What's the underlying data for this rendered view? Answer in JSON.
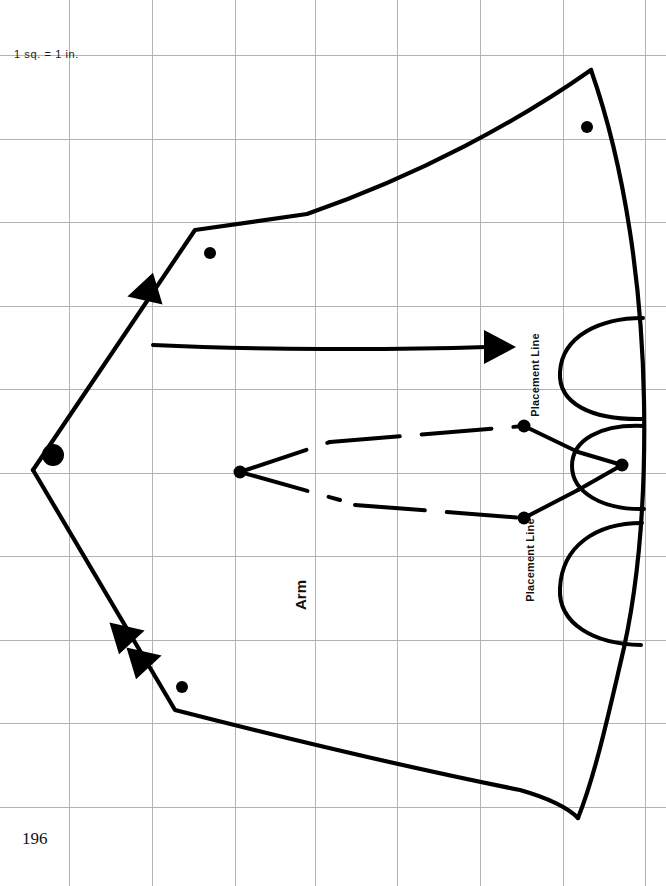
{
  "page": {
    "width": 666,
    "height": 886,
    "background": "#ffffff",
    "page_number": "196"
  },
  "grid": {
    "note": "1 sq.  =  1 in.",
    "line_color": "#b3b3b3",
    "line_width": 1,
    "spacing_px": 83,
    "vertical_lines": [
      69,
      152,
      235,
      315,
      397,
      480,
      563,
      645
    ],
    "horizontal_lines": [
      55,
      139,
      222,
      306,
      389,
      473,
      556,
      640,
      723,
      807
    ]
  },
  "pattern": {
    "label": "Arm",
    "ink_color": "#000000",
    "outline_width": 4,
    "placement_lines": [
      {
        "id": "top",
        "text": "Placement Line"
      },
      {
        "id": "bottom",
        "text": "Placement Line"
      }
    ],
    "markings": {
      "grain_arrow": {
        "name": "grainline-arrow",
        "from_x": 153,
        "to_x": 512,
        "y": 348
      },
      "dots": [
        {
          "cx": 53,
          "cy": 455,
          "r": 11
        },
        {
          "cx": 210,
          "cy": 253,
          "r": 6
        },
        {
          "cx": 587,
          "cy": 127,
          "r": 6
        },
        {
          "cx": 182,
          "cy": 687,
          "r": 6
        }
      ],
      "pivot_dots": [
        {
          "cx": 240,
          "cy": 472,
          "r": 6
        },
        {
          "cx": 524,
          "cy": 426,
          "r": 6
        },
        {
          "cx": 524,
          "cy": 518,
          "r": 6
        },
        {
          "cx": 622,
          "cy": 465,
          "r": 6
        }
      ],
      "notches": [
        {
          "cx": 148,
          "cy": 290,
          "rotation": 205
        },
        {
          "cx": 124,
          "cy": 637,
          "rotation": 55
        },
        {
          "cx": 141,
          "cy": 662,
          "rotation": 55
        }
      ]
    }
  }
}
